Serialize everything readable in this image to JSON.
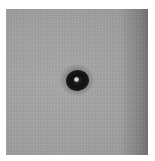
{
  "image": {
    "description": "Grayscale photograph showing a dark elliptical blob with a bright central spot on a mottled gray background",
    "colors": {
      "background": "#ffffff",
      "field": "#a5a5a5",
      "blob": "#111111",
      "spot": "#e8e8e8"
    }
  }
}
